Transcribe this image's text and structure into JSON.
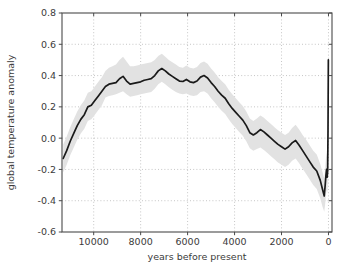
{
  "chart_data": {
    "type": "line",
    "title": "",
    "xlabel": "years before present",
    "ylabel": "global temperature anomaly",
    "xlim": [
      11350,
      -150
    ],
    "ylim": [
      -0.6,
      0.8
    ],
    "x_ticks": [
      10000,
      8000,
      6000,
      4000,
      2000,
      0
    ],
    "x_tick_labels": [
      "10000",
      "8000",
      "6000",
      "4000",
      "2000",
      "0"
    ],
    "y_ticks": [
      -0.6,
      -0.4,
      -0.2,
      0.0,
      0.2,
      0.4,
      0.6,
      0.8
    ],
    "y_tick_labels": [
      "-0.6",
      "-0.4",
      "-0.2",
      "0.0",
      "0.2",
      "0.4",
      "0.6",
      "0.8"
    ],
    "x_inverted": true,
    "grid": true,
    "grid_style": "dotted",
    "legend": null,
    "line_color": "#1a1a1a",
    "band_color": "#e2e2e2",
    "band_label": "uncertainty band",
    "series": [
      {
        "name": "global temperature anomaly",
        "x": [
          11300,
          11150,
          11000,
          10850,
          10700,
          10550,
          10400,
          10250,
          10100,
          9950,
          9800,
          9650,
          9500,
          9350,
          9200,
          9050,
          8900,
          8750,
          8600,
          8450,
          8300,
          8150,
          8000,
          7850,
          7700,
          7550,
          7400,
          7250,
          7100,
          6950,
          6800,
          6650,
          6500,
          6350,
          6200,
          6050,
          5900,
          5750,
          5600,
          5450,
          5300,
          5150,
          5000,
          4850,
          4700,
          4550,
          4400,
          4250,
          4100,
          3950,
          3800,
          3650,
          3500,
          3350,
          3200,
          3050,
          2900,
          2750,
          2600,
          2450,
          2300,
          2150,
          2000,
          1850,
          1700,
          1550,
          1400,
          1250,
          1100,
          950,
          800,
          650,
          500,
          350,
          250,
          180,
          140,
          110,
          80,
          55,
          35,
          20,
          5
        ],
        "y": [
          -0.13,
          -0.08,
          -0.02,
          0.03,
          0.08,
          0.12,
          0.15,
          0.2,
          0.21,
          0.24,
          0.27,
          0.3,
          0.33,
          0.345,
          0.35,
          0.355,
          0.38,
          0.395,
          0.365,
          0.345,
          0.35,
          0.355,
          0.36,
          0.37,
          0.375,
          0.38,
          0.4,
          0.43,
          0.445,
          0.43,
          0.41,
          0.395,
          0.38,
          0.365,
          0.362,
          0.375,
          0.36,
          0.355,
          0.365,
          0.39,
          0.4,
          0.385,
          0.355,
          0.33,
          0.3,
          0.275,
          0.255,
          0.22,
          0.19,
          0.165,
          0.14,
          0.115,
          0.08,
          0.035,
          0.02,
          0.035,
          0.055,
          0.04,
          0.02,
          0.0,
          -0.02,
          -0.04,
          -0.055,
          -0.07,
          -0.055,
          -0.03,
          -0.015,
          -0.045,
          -0.08,
          -0.115,
          -0.15,
          -0.185,
          -0.21,
          -0.27,
          -0.33,
          -0.37,
          -0.3,
          -0.24,
          -0.2,
          -0.25,
          -0.21,
          0.05,
          0.5
        ],
        "band_lower": [
          -0.22,
          -0.17,
          -0.11,
          -0.06,
          -0.01,
          0.03,
          0.06,
          0.11,
          0.12,
          0.15,
          0.18,
          0.21,
          0.26,
          0.27,
          0.275,
          0.28,
          0.29,
          0.3,
          0.28,
          0.265,
          0.27,
          0.275,
          0.28,
          0.285,
          0.29,
          0.295,
          0.315,
          0.345,
          0.36,
          0.345,
          0.325,
          0.31,
          0.295,
          0.285,
          0.28,
          0.285,
          0.275,
          0.27,
          0.275,
          0.295,
          0.3,
          0.285,
          0.255,
          0.23,
          0.2,
          0.175,
          0.155,
          0.12,
          0.09,
          0.065,
          0.04,
          0.015,
          -0.02,
          -0.065,
          -0.08,
          -0.07,
          -0.06,
          -0.075,
          -0.095,
          -0.115,
          -0.135,
          -0.155,
          -0.17,
          -0.185,
          -0.17,
          -0.145,
          -0.13,
          -0.16,
          -0.195,
          -0.23,
          -0.265,
          -0.3,
          -0.325,
          -0.385,
          -0.44,
          -0.47,
          -0.42,
          -0.37,
          -0.33,
          -0.35,
          -0.32,
          -0.2,
          0.35
        ],
        "band_upper": [
          -0.04,
          0.01,
          0.07,
          0.12,
          0.17,
          0.21,
          0.24,
          0.29,
          0.3,
          0.33,
          0.36,
          0.39,
          0.43,
          0.45,
          0.46,
          0.47,
          0.5,
          0.52,
          0.49,
          0.46,
          0.46,
          0.465,
          0.47,
          0.475,
          0.48,
          0.485,
          0.5,
          0.525,
          0.54,
          0.52,
          0.5,
          0.485,
          0.47,
          0.455,
          0.45,
          0.465,
          0.45,
          0.445,
          0.455,
          0.48,
          0.49,
          0.475,
          0.445,
          0.42,
          0.39,
          0.365,
          0.345,
          0.31,
          0.28,
          0.255,
          0.23,
          0.205,
          0.17,
          0.125,
          0.11,
          0.125,
          0.145,
          0.13,
          0.11,
          0.09,
          0.07,
          0.05,
          0.035,
          0.02,
          0.035,
          0.065,
          0.085,
          0.055,
          0.02,
          -0.01,
          -0.045,
          -0.08,
          -0.105,
          -0.165,
          -0.22,
          -0.26,
          -0.19,
          -0.13,
          -0.09,
          -0.14,
          -0.1,
          0.15,
          0.62
        ]
      }
    ]
  },
  "figure": {
    "background_color": "#ffffff",
    "axes_color": "#4a4a4a"
  }
}
